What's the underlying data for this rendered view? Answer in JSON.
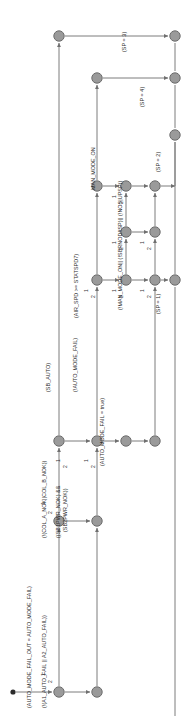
{
  "diagram": {
    "orientation": "rotated-90-ccw",
    "colors": {
      "node_fill": "#9a9a9a",
      "node_stroke": "#6d6d6d",
      "edge": "#7d7d7d",
      "text": "#2c2c2c",
      "start_dot": "#2b2b2b",
      "background": "#ffffff"
    },
    "guards": [
      {
        "id": "g-auto-mode-fail-out",
        "text": "(AUTO_MODE_FAIL_OUT = AUTO_MODE_FAIL)",
        "x": 27,
        "y": 708
      },
      {
        "id": "g-a1-a2-auto-fail",
        "text": "(!(A1_AUTO_FAIL || A2_AUTO_FAIL))",
        "x": 42,
        "y": 708
      },
      {
        "id": "g-col-nok",
        "text": "(!(COL_A_NOK||COL_B_NOK))",
        "x": 42,
        "y": 538
      },
      {
        "id": "g-sbpwr-nok",
        "text": "((SB1PWR_NOK) &&",
        "x": 56,
        "y": 538
      },
      {
        "id": "g-sbpwr-nok2",
        "text": "(SB2PWR_NOK))",
        "x": 63,
        "y": 532
      },
      {
        "id": "g-sb-auto",
        "text": "(SB_AUTO)",
        "x": 46,
        "y": 392
      },
      {
        "id": "g-not-auto-mode-fail",
        "text": "(!AUTO_MODE_FAIL)",
        "x": 73,
        "y": 392
      },
      {
        "id": "g-auto-mode-fail-true",
        "text": "(AUTO_MODE_FAIL = true)",
        "x": 100,
        "y": 466
      },
      {
        "id": "g-air-spd",
        "text": "(AIR_SPD >= STATSPD7)",
        "x": 74,
        "y": 318
      },
      {
        "id": "g-man-mode-on",
        "text": "MAN_MODE_ON",
        "x": 91,
        "y": 190
      },
      {
        "id": "g-not-man-mode-on",
        "text": "(!MAN_MODE_ON|| (!SBRNOD#SP)|| (!NOS|UPSP))",
        "x": 118,
        "y": 310
      },
      {
        "id": "g-sp-3",
        "text": "(SP = 3)",
        "x": 122,
        "y": 52
      },
      {
        "id": "g-sp-4",
        "text": "(SP = 4)",
        "x": 140,
        "y": 107
      },
      {
        "id": "g-sp-2",
        "text": "(SP = 2)",
        "x": 156,
        "y": 172
      },
      {
        "id": "g-sp-1",
        "text": "(SP = 1)",
        "x": 156,
        "y": 314
      }
    ],
    "branch_numbers": [
      {
        "id": "b1-a",
        "text": "1",
        "x": 40,
        "y": 676
      },
      {
        "id": "b2-a",
        "text": "2",
        "x": 47,
        "y": 683
      },
      {
        "id": "b1-b",
        "text": "1",
        "x": 40,
        "y": 505
      },
      {
        "id": "b2-b",
        "text": "2",
        "x": 47,
        "y": 514
      },
      {
        "id": "b1-c",
        "text": "1",
        "x": 55,
        "y": 462
      },
      {
        "id": "b2-c",
        "text": "2",
        "x": 62,
        "y": 468
      },
      {
        "id": "b1-d",
        "text": "1",
        "x": 83,
        "y": 462
      },
      {
        "id": "b2-d",
        "text": "2",
        "x": 90,
        "y": 468
      },
      {
        "id": "b1-e",
        "text": "1",
        "x": 83,
        "y": 292
      },
      {
        "id": "b2-e",
        "text": "2",
        "x": 90,
        "y": 298
      },
      {
        "id": "b1-f",
        "text": "1",
        "x": 111,
        "y": 292
      },
      {
        "id": "b2-f",
        "text": "2",
        "x": 118,
        "y": 298
      },
      {
        "id": "b1-g",
        "text": "1",
        "x": 111,
        "y": 244
      },
      {
        "id": "b2-g",
        "text": "2",
        "x": 118,
        "y": 250
      },
      {
        "id": "b1-h",
        "text": "1",
        "x": 111,
        "y": 198
      },
      {
        "id": "b2-h",
        "text": "2",
        "x": 118,
        "y": 204
      },
      {
        "id": "b1-i",
        "text": "1",
        "x": 139,
        "y": 292
      },
      {
        "id": "b2-i",
        "text": "2",
        "x": 146,
        "y": 298
      },
      {
        "id": "b1-j",
        "text": "1",
        "x": 139,
        "y": 244
      },
      {
        "id": "b2-j",
        "text": "2",
        "x": 146,
        "y": 250
      }
    ],
    "nodes": [
      {
        "id": "n-start",
        "cx": 13,
        "cy": 692,
        "r": 2.6,
        "kind": "start"
      },
      {
        "id": "n1",
        "cx": 59,
        "cy": 692,
        "r": 5.2,
        "kind": "place"
      },
      {
        "id": "n2",
        "cx": 97,
        "cy": 692,
        "r": 5.2,
        "kind": "place"
      },
      {
        "id": "n3",
        "cx": 59,
        "cy": 521,
        "r": 5.2,
        "kind": "place"
      },
      {
        "id": "n4",
        "cx": 97,
        "cy": 521,
        "r": 5.2,
        "kind": "place"
      },
      {
        "id": "n5",
        "cx": 59,
        "cy": 441,
        "r": 5.2,
        "kind": "place"
      },
      {
        "id": "n6",
        "cx": 97,
        "cy": 441,
        "r": 5.2,
        "kind": "place"
      },
      {
        "id": "n7",
        "cx": 126,
        "cy": 441,
        "r": 5.2,
        "kind": "place"
      },
      {
        "id": "n8",
        "cx": 155,
        "cy": 441,
        "r": 5.2,
        "kind": "place"
      },
      {
        "id": "n9",
        "cx": 97,
        "cy": 280,
        "r": 5.2,
        "kind": "place"
      },
      {
        "id": "n10",
        "cx": 126,
        "cy": 280,
        "r": 5.2,
        "kind": "place"
      },
      {
        "id": "n11",
        "cx": 155,
        "cy": 280,
        "r": 5.2,
        "kind": "place"
      },
      {
        "id": "n12",
        "cx": 126,
        "cy": 232,
        "r": 5.2,
        "kind": "place"
      },
      {
        "id": "n13",
        "cx": 155,
        "cy": 232,
        "r": 5.2,
        "kind": "place"
      },
      {
        "id": "n14",
        "cx": 126,
        "cy": 186,
        "r": 5.2,
        "kind": "place"
      },
      {
        "id": "n15",
        "cx": 155,
        "cy": 186,
        "r": 5.2,
        "kind": "place"
      },
      {
        "id": "n16",
        "cx": 97,
        "cy": 186,
        "r": 5.2,
        "kind": "place"
      },
      {
        "id": "n17",
        "cx": 97,
        "cy": 78,
        "r": 5.2,
        "kind": "place"
      },
      {
        "id": "n18",
        "cx": 175,
        "cy": 78,
        "r": 5.2,
        "kind": "place"
      },
      {
        "id": "n19",
        "cx": 59,
        "cy": 36,
        "r": 5.2,
        "kind": "place"
      },
      {
        "id": "n20",
        "cx": 175,
        "cy": 36,
        "r": 5.2,
        "kind": "place"
      },
      {
        "id": "n21",
        "cx": 175,
        "cy": 135,
        "r": 5.2,
        "kind": "place"
      },
      {
        "id": "n22",
        "cx": 175,
        "cy": 280,
        "r": 5.2,
        "kind": "place"
      }
    ]
  }
}
